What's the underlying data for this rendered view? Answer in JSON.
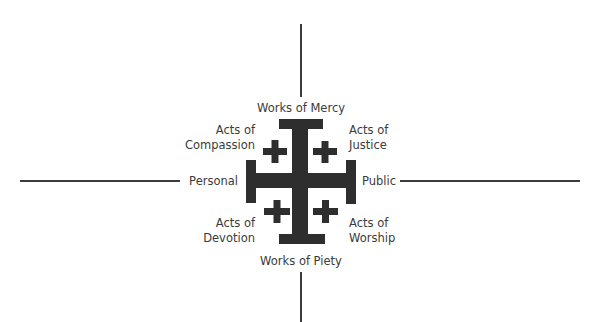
{
  "diagram": {
    "type": "quadrant-cross",
    "colors": {
      "cross": "#2e2e2e",
      "lines": "#3c3c3c",
      "text": "#3b3b3b",
      "background": "#ffffff"
    },
    "icon": "jerusalem-cross-icon",
    "axes": {
      "top": "Works of Mercy",
      "bottom": "Works of Piety",
      "left": "Personal",
      "right": "Public"
    },
    "quadrants": {
      "top_left": {
        "line1": "Acts of",
        "line2": "Compassion"
      },
      "top_right": {
        "line1": "Acts of",
        "line2": "Justice"
      },
      "bottom_left": {
        "line1": "Acts of",
        "line2": "Devotion"
      },
      "bottom_right": {
        "line1": "Acts of",
        "line2": "Worship"
      }
    }
  }
}
